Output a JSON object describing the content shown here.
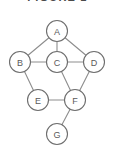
{
  "caption": {
    "text": "FIGURE 1",
    "note": "clipped-top-text"
  },
  "diagram": {
    "node_radius": 10.5,
    "colors": {
      "background": "#ffffff",
      "node_fill": "#ffffff",
      "node_stroke": "#6e6e6e",
      "edge_stroke": "#8d8d8d",
      "label_text": "#5a5a5a"
    },
    "nodes": [
      {
        "id": "A",
        "label": "A",
        "x": 57,
        "y": 31
      },
      {
        "id": "B",
        "label": "B",
        "x": 20,
        "y": 62
      },
      {
        "id": "C",
        "label": "C",
        "x": 57,
        "y": 62
      },
      {
        "id": "D",
        "label": "D",
        "x": 94,
        "y": 62
      },
      {
        "id": "E",
        "label": "E",
        "x": 38,
        "y": 100
      },
      {
        "id": "F",
        "label": "F",
        "x": 75,
        "y": 100
      },
      {
        "id": "G",
        "label": "G",
        "x": 57,
        "y": 134
      }
    ],
    "edges": [
      {
        "from": "A",
        "to": "B"
      },
      {
        "from": "A",
        "to": "C"
      },
      {
        "from": "A",
        "to": "D"
      },
      {
        "from": "B",
        "to": "C"
      },
      {
        "from": "B",
        "to": "E"
      },
      {
        "from": "C",
        "to": "D"
      },
      {
        "from": "C",
        "to": "F"
      },
      {
        "from": "D",
        "to": "F"
      },
      {
        "from": "E",
        "to": "F"
      },
      {
        "from": "F",
        "to": "G"
      }
    ]
  }
}
